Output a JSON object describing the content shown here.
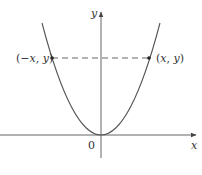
{
  "figure": {
    "axes": {
      "x_label": "x",
      "y_label": "y",
      "origin_label": "0"
    },
    "points": [
      {
        "label_parts": [
          "(−",
          "x",
          ", ",
          "y",
          ")"
        ],
        "label": "(−x, y)"
      },
      {
        "label_parts": [
          "(",
          "x",
          ", ",
          "y",
          ")"
        ],
        "label": "(x, y)"
      }
    ],
    "dashed_line": "horizontal segment joining (−x, y) and (x, y)",
    "colors": {
      "curve": "#555555",
      "axis": "#666666",
      "text": "#333333",
      "dash": "#555555"
    }
  }
}
